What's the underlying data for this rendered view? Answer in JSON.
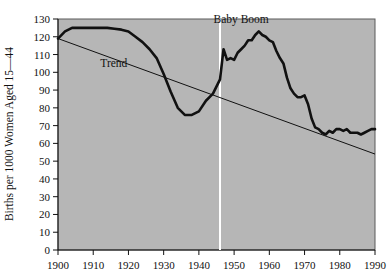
{
  "chart_data": {
    "type": "line",
    "title": "",
    "xlabel": "",
    "ylabel": "Births per 1000 Women Aged 15—44",
    "xlim": [
      1900,
      1990
    ],
    "ylim": [
      0,
      130
    ],
    "grid": false,
    "legend": "none",
    "x_ticks": [
      "1900",
      "1910",
      "1920",
      "1930",
      "1940",
      "1950",
      "1960",
      "1970",
      "1980",
      "1990"
    ],
    "x_tick_values": [
      1900,
      1910,
      1920,
      1930,
      1940,
      1950,
      1960,
      1970,
      1980,
      1990
    ],
    "y_ticks": [
      "0",
      "10",
      "20",
      "30",
      "40",
      "50",
      "60",
      "70",
      "80",
      "90",
      "100",
      "110",
      "120",
      "130"
    ],
    "y_tick_values": [
      0,
      10,
      20,
      30,
      40,
      50,
      60,
      70,
      80,
      90,
      100,
      110,
      120,
      130
    ],
    "series": [
      {
        "name": "Birth rate",
        "style": "thick-black",
        "x": [
          1900,
          1902,
          1904,
          1906,
          1908,
          1910,
          1912,
          1914,
          1916,
          1918,
          1920,
          1922,
          1924,
          1926,
          1928,
          1930,
          1932,
          1934,
          1936,
          1938,
          1940,
          1942,
          1944,
          1946,
          1947,
          1948,
          1949,
          1950,
          1951,
          1952,
          1953,
          1954,
          1955,
          1956,
          1957,
          1958,
          1959,
          1960,
          1961,
          1962,
          1963,
          1964,
          1965,
          1966,
          1967,
          1968,
          1969,
          1970,
          1971,
          1972,
          1973,
          1974,
          1975,
          1976,
          1977,
          1978,
          1979,
          1980,
          1981,
          1982,
          1983,
          1984,
          1985,
          1986,
          1987,
          1988,
          1989,
          1990
        ],
        "values": [
          119,
          123,
          125,
          125,
          125,
          125,
          125,
          125,
          124.5,
          124,
          123,
          120,
          117,
          113,
          108,
          99,
          89,
          80,
          76,
          76,
          78,
          84,
          88,
          96,
          113,
          107,
          108,
          107,
          111,
          113,
          115,
          118,
          118,
          121,
          123,
          121,
          120,
          118,
          117,
          112,
          108,
          105,
          97,
          91,
          88,
          86,
          86,
          87,
          82,
          74,
          69,
          68,
          66,
          65,
          67,
          66,
          68,
          68,
          67,
          68,
          66,
          66,
          66,
          65,
          66,
          67,
          68,
          68
        ]
      },
      {
        "name": "Trend",
        "style": "thin-black",
        "x": [
          1900,
          1990
        ],
        "values": [
          119,
          54
        ]
      }
    ],
    "annotations": [
      {
        "name": "trend-label",
        "text": "Trend",
        "x": 1912,
        "y": 103
      },
      {
        "name": "baby-boom-label",
        "text": "Baby Boom",
        "x": 1952,
        "y": 128
      },
      {
        "name": "baby-boom-marker",
        "text": "",
        "x": 1946,
        "y": 0,
        "type": "vline",
        "color": "#ffffff"
      }
    ]
  },
  "colors": {
    "plot_background": "#b6b6b6",
    "page_background": "#ffffff",
    "series": "#111111",
    "trend": "#111111",
    "marker": "#ffffff",
    "frame": "#5a5a5a"
  }
}
